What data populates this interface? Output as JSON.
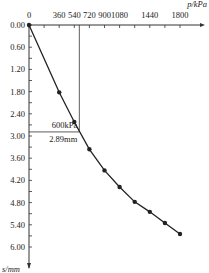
{
  "chart_data": {
    "type": "line",
    "title": "",
    "xlabel": "p/kPa",
    "ylabel": "s/mm",
    "x_ticks": [
      "0",
      "360",
      "540",
      "720",
      "900",
      "1080",
      "1440",
      "1800"
    ],
    "y_ticks": [
      "0.00",
      "0.60",
      "1.20",
      "1.80",
      "2.40",
      "3.00",
      "3.60",
      "4.20",
      "4.80",
      "5.40",
      "6.00"
    ],
    "xlim": [
      0,
      1800
    ],
    "ylim": [
      0,
      6.0
    ],
    "series": [
      {
        "name": "load-settlement",
        "x": [
          0,
          360,
          540,
          720,
          900,
          1080,
          1260,
          1440,
          1620,
          1800
        ],
        "y": [
          0.0,
          1.82,
          2.62,
          3.36,
          3.93,
          4.38,
          4.78,
          5.05,
          5.35,
          5.65
        ]
      }
    ],
    "annotations": [
      {
        "text": "600kPa",
        "x": 600,
        "y": 2.89
      },
      {
        "text": "2.89mm",
        "x": 600,
        "y": 2.89
      }
    ],
    "grid": false,
    "legend": "none"
  }
}
